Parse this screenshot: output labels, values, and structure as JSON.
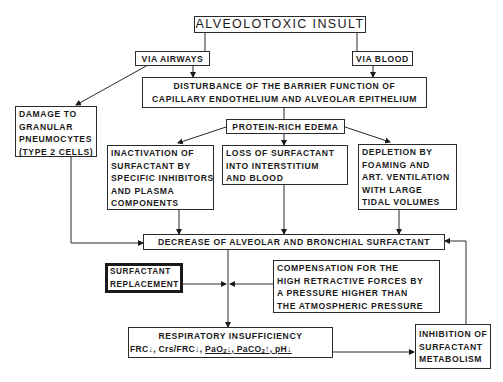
{
  "title": "ALVEOLOTOXIC INSULT",
  "routes": {
    "airways": "VIA AIRWAYS",
    "blood": "VIA BLOOD"
  },
  "disturbance": {
    "line1": "DISTURBANCE OF THE BARRIER FUNCTION OF",
    "line2": "CAPILLARY ENDOTHELIUM AND ALVEOLAR EPITHELIUM"
  },
  "damage": {
    "lines": [
      "DAMAGE TO",
      "GRANULAR",
      "PNEUMOCYTES",
      "(TYPE 2 CELLS)"
    ]
  },
  "edema": "PROTEIN-RICH EDEMA",
  "inactivation": {
    "lines": [
      "INACTIVATION OF",
      "SURFACTANT BY",
      "SPECIFIC INHIBITORS",
      "AND PLASMA",
      "COMPONENTS"
    ]
  },
  "loss": {
    "lines": [
      "LOSS OF SURFACTANT",
      "INTO INTERSTITIUM",
      "AND BLOOD"
    ]
  },
  "depletion": {
    "lines": [
      "DEPLETION BY",
      "FOAMING AND",
      "ART. VENTILATION",
      "WITH LARGE",
      "TIDAL VOLUMES"
    ]
  },
  "decrease": "DECREASE OF ALVEOLAR AND BRONCHIAL SURFACTANT",
  "replacement": {
    "lines": [
      "SURFACTANT",
      "REPLACEMENT"
    ]
  },
  "compensation": {
    "lines": [
      "COMPENSATION FOR THE",
      "HIGH RETRACTIVE FORCES BY",
      "A PRESSURE HIGHER THAN",
      "THE ATMOSPHERIC PRESSURE"
    ]
  },
  "respiratory": {
    "heading": "RESPIRATORY INSUFFICIENCY",
    "frc": "FRC",
    "crs": "Crs/FRC",
    "pao2": "PaO",
    "paco2": "PaCO",
    "ph": "pH",
    "sub2": "2",
    "down": "↓",
    "up": "↑",
    "sep": ", "
  },
  "inhibition": {
    "lines": [
      "INHIBITION OF",
      "SURFACTANT",
      "METABOLISM"
    ]
  }
}
